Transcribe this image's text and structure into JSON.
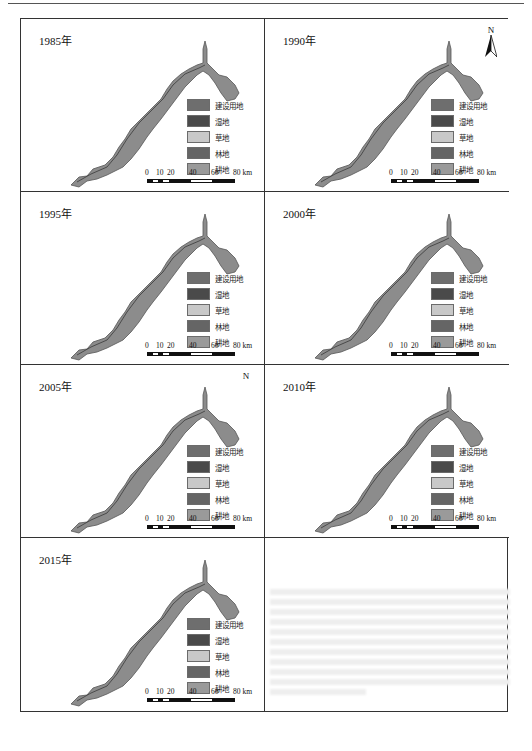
{
  "figure": {
    "panels": [
      {
        "year_label": "1985年",
        "north_arrow": false,
        "north_label": ""
      },
      {
        "year_label": "1990年",
        "north_arrow": true,
        "north_label": "N"
      },
      {
        "year_label": "1995年",
        "north_arrow": false,
        "north_label": ""
      },
      {
        "year_label": "2000年",
        "north_arrow": false,
        "north_label": ""
      },
      {
        "year_label": "2005年",
        "north_arrow": false,
        "north_label": "N"
      },
      {
        "year_label": "2010年",
        "north_arrow": false,
        "north_label": ""
      },
      {
        "year_label": "2015年",
        "north_arrow": false,
        "north_label": ""
      }
    ],
    "legend": [
      {
        "label": "建设用地",
        "color": "#6e6e6e"
      },
      {
        "label": "湿地",
        "color": "#4a4a4a"
      },
      {
        "label": "草地",
        "color": "#c8c8c8"
      },
      {
        "label": "林地",
        "color": "#656565"
      },
      {
        "label": "耕地",
        "color": "#9a9a9a"
      }
    ],
    "scale_bar": {
      "ticks": [
        "0",
        "10",
        "20",
        "40",
        "60",
        "80 km"
      ],
      "unit": "km"
    },
    "map_fill": "#8c8c8c",
    "map_stroke": "#555555"
  }
}
